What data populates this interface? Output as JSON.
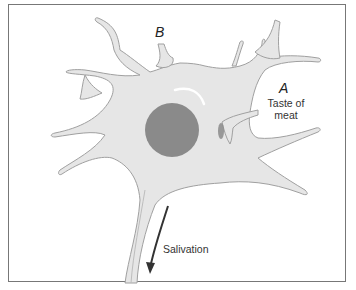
{
  "diagram": {
    "type": "neuron",
    "labels": {
      "b": "B",
      "a": "A",
      "taste_line1": "Taste of",
      "taste_line2": "meat",
      "output": "Salivation"
    },
    "colors": {
      "cell_fill": "#e6e6e6",
      "cell_stroke": "#9a9a9a",
      "nucleus": "#8a8a8a",
      "synapse_a": "#8a8a8a",
      "frame": "#777777",
      "arrow": "#333333"
    }
  }
}
